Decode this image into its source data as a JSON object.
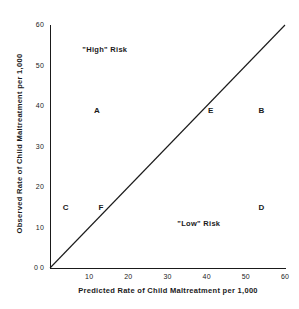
{
  "chart_data": {
    "type": "scatter",
    "title": "",
    "xlabel": "Predicted Rate of Child Maltreatment per 1,000",
    "ylabel": "Observed Rate of Child Maltreatment per 1,000",
    "xlim": [
      0,
      60
    ],
    "ylim": [
      0,
      60
    ],
    "xticks": [
      "0",
      "10",
      "20",
      "30",
      "40",
      "50",
      "60"
    ],
    "yticks": [
      "0",
      "10",
      "20",
      "30",
      "40",
      "50",
      "60"
    ],
    "xtick_values": [
      0,
      10,
      20,
      30,
      40,
      50,
      60
    ],
    "ytick_values": [
      0,
      10,
      20,
      30,
      40,
      50,
      60
    ],
    "grid": false,
    "legend": "none",
    "points": [
      {
        "label": "A",
        "x": 12,
        "y": 39
      },
      {
        "label": "B",
        "x": 54,
        "y": 39
      },
      {
        "label": "C",
        "x": 4,
        "y": 15
      },
      {
        "label": "D",
        "x": 54,
        "y": 15
      },
      {
        "label": "E",
        "x": 41,
        "y": 39
      },
      {
        "label": "F",
        "x": 13,
        "y": 15
      }
    ],
    "reference_line": {
      "name": "identity-line",
      "description": "y = x diagonal",
      "from": [
        0,
        0
      ],
      "to": [
        60,
        60
      ]
    },
    "annotations": [
      {
        "text": "\"High\" Risk",
        "x": 14,
        "y": 54
      },
      {
        "text": "\"Low\" Risk",
        "x": 38,
        "y": 11
      }
    ],
    "colors": {
      "axis": "#1a1a1a",
      "line": "#1a1a1a",
      "text": "#1a1a1a",
      "background": "#ffffff"
    }
  }
}
